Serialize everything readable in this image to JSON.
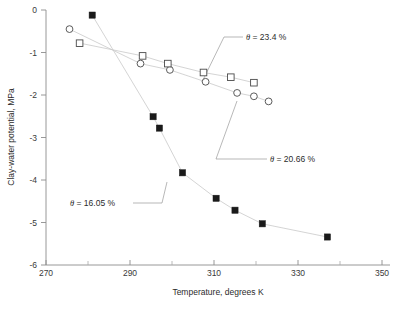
{
  "chart_data": {
    "type": "scatter",
    "title": "",
    "xlabel": "Temperature, degrees K",
    "ylabel": "Clay-water potential, MPa",
    "xlim": [
      270,
      355
    ],
    "ylim": [
      -6,
      0
    ],
    "grid": false,
    "legend_position": "inline-annotations",
    "xticks": [
      270,
      290,
      310,
      330,
      350
    ],
    "xtick_labels": [
      "270",
      "290",
      "310",
      "330",
      "350"
    ],
    "xticks_minor": [
      280,
      300,
      320,
      340
    ],
    "yticks": [
      0,
      -1,
      -2,
      -3,
      -4,
      -5,
      -6
    ],
    "ytick_labels": [
      "0",
      "-1",
      "-2",
      "-3",
      "-4",
      "-5",
      "-6"
    ],
    "series": [
      {
        "name": "theta = 16.05 %",
        "marker": "filled-square",
        "annotation": "θ = 16.05 %",
        "x": [
          281.0,
          295.5,
          297.0,
          302.5,
          310.5,
          315.0,
          321.5,
          337.0
        ],
        "y": [
          -0.12,
          -2.51,
          -2.78,
          -3.83,
          -4.43,
          -4.71,
          -5.03,
          -5.34
        ]
      },
      {
        "name": "theta = 20.66 %",
        "marker": "open-circle",
        "annotation": "θ = 20.66 %",
        "x": [
          275.6,
          292.5,
          299.5,
          308.0,
          315.5,
          319.5,
          323.0
        ],
        "y": [
          -0.45,
          -1.26,
          -1.41,
          -1.69,
          -1.95,
          -2.03,
          -2.15
        ]
      },
      {
        "name": "theta = 23.4 %",
        "marker": "open-square",
        "annotation": "θ = 23.4 %",
        "x": [
          278.0,
          293.0,
          299.0,
          307.5,
          314.0,
          319.5
        ],
        "y": [
          -0.78,
          -1.08,
          -1.26,
          -1.47,
          -1.58,
          -1.71
        ]
      }
    ],
    "annotations": [
      {
        "label": "θ = 23.4 %",
        "theta": "θ",
        "rest": " = 23.4 %"
      },
      {
        "label": "θ = 20.66 %",
        "theta": "θ",
        "rest": " = 20.66 %"
      },
      {
        "label": "θ = 16.05 %",
        "theta": "θ",
        "rest": " = 16.05 %"
      }
    ],
    "colors": {
      "filled_marker": "#1a1a1a",
      "open_marker_stroke": "#4a4a4a",
      "line": "#c9c9c9",
      "axis": "#8d8d8d",
      "text": "#2b2b2b",
      "background": "#ffffff"
    }
  }
}
